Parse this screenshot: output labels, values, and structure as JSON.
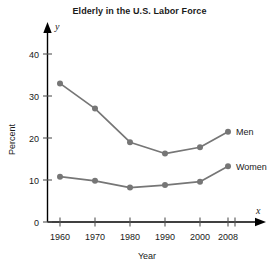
{
  "chart_data": {
    "type": "line",
    "title": "Elderly in the U.S. Labor Force",
    "xlabel": "Year",
    "ylabel": "Percent",
    "x_axis_symbol": "x",
    "y_axis_symbol": "y",
    "categories": [
      "1960",
      "1970",
      "1980",
      "1990",
      "2000",
      "2008"
    ],
    "x": [
      1960,
      1970,
      1980,
      1990,
      2000,
      2008
    ],
    "xtick_labels": [
      "1960",
      "1970",
      "1980",
      "1990",
      "2000",
      "2008"
    ],
    "ytick_labels": [
      "0",
      "10",
      "20",
      "30",
      "40"
    ],
    "yticks": [
      0,
      10,
      20,
      30,
      40
    ],
    "ylim": [
      0,
      44
    ],
    "xlim": [
      1954,
      2014
    ],
    "grid": false,
    "legend_position": "right-inline",
    "series": [
      {
        "name": "Men",
        "label": "Men",
        "color": "#767676",
        "values": [
          33,
          27,
          19,
          16.3,
          17.8,
          21.5
        ]
      },
      {
        "name": "Women",
        "label": "Women",
        "color": "#767676",
        "values": [
          10.8,
          9.8,
          8.2,
          8.8,
          9.6,
          13.3
        ]
      }
    ]
  },
  "colors": {
    "axis": "#000000",
    "series": "#767676",
    "text": "#1a1a1a",
    "background": "#ffffff"
  }
}
